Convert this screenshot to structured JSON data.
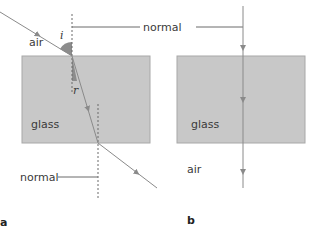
{
  "diagram": {
    "panel_a": {
      "label": "a",
      "medium_top": "air",
      "medium_block": "glass",
      "angle_incidence": "i",
      "angle_refraction": "r",
      "normal_label": "normal"
    },
    "panel_b": {
      "label": "b",
      "medium_block": "glass",
      "medium_bottom": "air"
    },
    "shared_normal_label": "normal",
    "colors": {
      "glass": "#c8c8c8",
      "glass_border": "#a8a8a8",
      "ray": "#8a8a8a",
      "angle_fill": "#8c8c8c",
      "text": "#3a3a3a"
    }
  }
}
